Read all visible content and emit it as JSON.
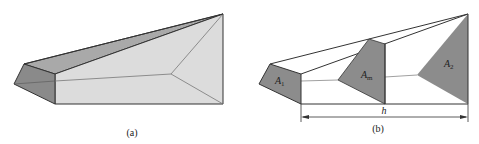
{
  "figure_a": {
    "caption": "(a)"
  },
  "figure_b": {
    "caption": "(b)",
    "labels": {
      "a1": "A",
      "a1_sub": "1",
      "am": "A",
      "am_sub": "m",
      "a2": "A",
      "a2_sub": "2",
      "height": "h"
    }
  },
  "colors": {
    "dark_face": "#8a8a8a",
    "light_face": "#dcdcdc",
    "top_face": "#a9a9a9",
    "section_fill": "#8c8c8c",
    "line": "#333333",
    "inner_line": "#6f6f6f"
  }
}
